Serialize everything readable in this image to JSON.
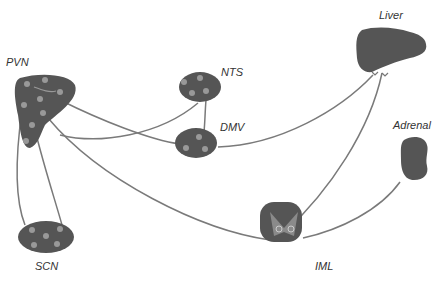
{
  "diagram": {
    "nodes": [
      {
        "id": "pvn",
        "label": "PVN"
      },
      {
        "id": "nts",
        "label": "NTS"
      },
      {
        "id": "dmv",
        "label": "DMV"
      },
      {
        "id": "scn",
        "label": "SCN"
      },
      {
        "id": "liver",
        "label": "Liver"
      },
      {
        "id": "adrenal",
        "label": "Adrenal"
      },
      {
        "id": "iml",
        "label": "IML"
      }
    ],
    "edges": [
      {
        "from": "SCN",
        "to": "PVN"
      },
      {
        "from": "PVN",
        "to": "SCN"
      },
      {
        "from": "NTS",
        "to": "PVN"
      },
      {
        "from": "NTS",
        "to": "DMV"
      },
      {
        "from": "PVN",
        "to": "DMV"
      },
      {
        "from": "DMV",
        "to": "Liver"
      },
      {
        "from": "PVN",
        "to": "IML"
      },
      {
        "from": "IML",
        "to": "Liver"
      },
      {
        "from": "IML",
        "to": "Adrenal"
      }
    ],
    "colors": {
      "node_fill": "#555555",
      "node_dot": "#999999",
      "line": "#777777",
      "iml_inner": "#8a8a8a"
    }
  }
}
